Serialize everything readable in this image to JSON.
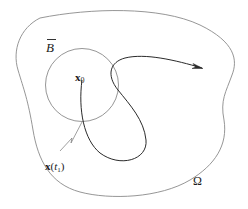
{
  "diagram": {
    "labels": {
      "ball_closure": "B",
      "initial_point_symbol": "x",
      "initial_point_subscript": "0",
      "exit_point_symbol": "x",
      "exit_point_paren_open": "(",
      "exit_point_time": "t",
      "exit_point_time_subscript": "1",
      "exit_point_paren_close": ")",
      "domain": "Ω"
    },
    "colors": {
      "domain_boundary": "#8a8a8a",
      "ball_boundary": "#8a8a8a",
      "trajectory": "#2a2a2a",
      "pointer": "#777777",
      "text": "#1a1a1a"
    }
  }
}
